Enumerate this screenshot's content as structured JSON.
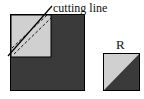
{
  "diagram": {
    "cutting_label": "cutting line",
    "result_label": "R",
    "colors": {
      "dark": "#3a3a3a",
      "light": "#d0d0d0",
      "stroke": "#000000",
      "background": "#ffffff"
    }
  }
}
